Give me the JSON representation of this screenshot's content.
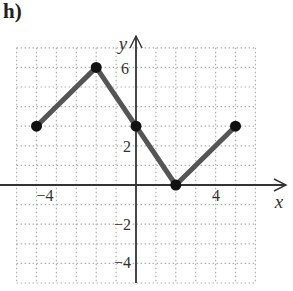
{
  "problem_label": "h)",
  "chart_data": {
    "type": "line",
    "title": "",
    "xlabel": "x",
    "ylabel": "y",
    "xlim": [
      -6,
      6
    ],
    "ylim": [
      -5,
      7
    ],
    "grid": true,
    "x_ticks_labeled": [
      -4,
      4
    ],
    "y_ticks_labeled": [
      6,
      2,
      -2,
      -4
    ],
    "series": [
      {
        "name": "piecewise linear",
        "color": "#555555",
        "points": [
          [
            -5,
            3
          ],
          [
            -2,
            6
          ],
          [
            0,
            3
          ],
          [
            2,
            0
          ],
          [
            5,
            3
          ]
        ]
      }
    ]
  },
  "ticks": {
    "x_neg4": "−4",
    "x_4": "4",
    "y_6": "6",
    "y_2": "2",
    "y_neg2": "−2",
    "y_neg4": "−4"
  },
  "axes": {
    "x": "x",
    "y": "y"
  }
}
